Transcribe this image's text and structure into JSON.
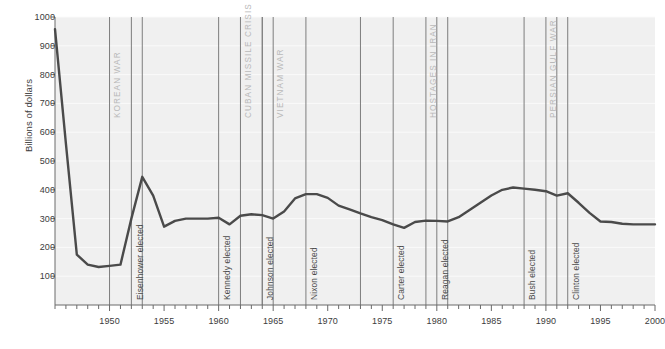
{
  "chart_data": {
    "type": "line",
    "title": "",
    "xlabel": "",
    "ylabel": "Billions of dollars",
    "xlim": [
      1945,
      2000
    ],
    "ylim": [
      0,
      1000
    ],
    "grid": true,
    "legend": "none",
    "line_color": "#4a4a4a",
    "plot_bg": "#f0f0f0",
    "y_ticks": [
      100,
      200,
      300,
      400,
      500,
      600,
      700,
      800,
      900,
      1000
    ],
    "y_tick_labels": [
      "100",
      "200",
      "300",
      "400",
      "500",
      "600",
      "700",
      "800",
      "900",
      "1000"
    ],
    "x_ticks": [
      1950,
      1955,
      1960,
      1965,
      1970,
      1975,
      1980,
      1985,
      1990,
      1995,
      2000
    ],
    "x_tick_labels": [
      "1950",
      "1955",
      "1960",
      "1965",
      "1970",
      "1975",
      "1980",
      "1985",
      "1990",
      "1995",
      "2000"
    ],
    "x_minor_tick_step": 1,
    "x": [
      1945,
      1946,
      1947,
      1948,
      1949,
      1950,
      1951,
      1952,
      1953,
      1954,
      1955,
      1956,
      1957,
      1958,
      1959,
      1960,
      1961,
      1962,
      1963,
      1964,
      1965,
      1966,
      1967,
      1968,
      1969,
      1970,
      1971,
      1972,
      1973,
      1974,
      1975,
      1976,
      1977,
      1978,
      1979,
      1980,
      1981,
      1982,
      1983,
      1984,
      1985,
      1986,
      1987,
      1988,
      1989,
      1990,
      1991,
      1992,
      1993,
      1994,
      1995,
      1996,
      1997,
      1998,
      1999,
      2000
    ],
    "y": [
      958,
      560,
      175,
      140,
      132,
      136,
      140,
      300,
      445,
      380,
      272,
      292,
      300,
      300,
      300,
      303,
      280,
      310,
      315,
      312,
      300,
      325,
      370,
      385,
      385,
      372,
      345,
      332,
      318,
      305,
      295,
      280,
      268,
      288,
      293,
      292,
      290,
      305,
      330,
      355,
      380,
      400,
      408,
      404,
      400,
      395,
      380,
      388,
      355,
      320,
      290,
      288,
      282,
      280,
      280,
      280
    ],
    "series": [
      {
        "name": "Defense spending",
        "values": [
          958,
          560,
          175,
          140,
          132,
          136,
          140,
          300,
          445,
          380,
          272,
          292,
          300,
          300,
          300,
          303,
          280,
          310,
          315,
          312,
          300,
          325,
          370,
          385,
          385,
          372,
          345,
          332,
          318,
          305,
          295,
          280,
          268,
          288,
          293,
          292,
          290,
          305,
          330,
          355,
          380,
          400,
          408,
          404,
          400,
          395,
          380,
          388,
          355,
          320,
          290,
          288,
          282,
          280,
          280,
          280
        ]
      }
    ],
    "event_spans": [
      {
        "label": "Korean War",
        "start": 1950,
        "end": 1953
      },
      {
        "label": "Cuban Missile Crisis",
        "start": 1962,
        "end": 1964
      },
      {
        "label": "Vietnam War",
        "start": 1965,
        "end": 1973
      },
      {
        "label": "Hostages in Iran",
        "start": 1979,
        "end": 1981
      },
      {
        "label": "Persian Gulf War",
        "start": 1990,
        "end": 1991
      }
    ],
    "event_points": [
      {
        "label": "Eisenhower elected",
        "year": 1952
      },
      {
        "label": "Kennedy elected",
        "year": 1960
      },
      {
        "label": "Johnson elected",
        "year": 1964
      },
      {
        "label": "Nixon elected",
        "year": 1968
      },
      {
        "label": "Carter elected",
        "year": 1976
      },
      {
        "label": "Reagan elected",
        "year": 1980
      },
      {
        "label": "Bush elected",
        "year": 1988
      },
      {
        "label": "Clinton elected",
        "year": 1992
      }
    ]
  }
}
